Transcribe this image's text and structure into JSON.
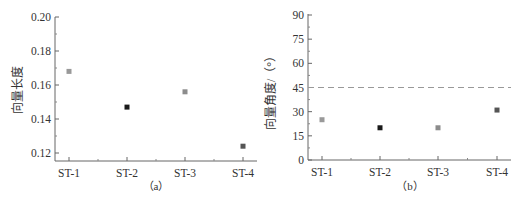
{
  "chart_data": [
    {
      "type": "scatter",
      "panel": "(a)",
      "caption": "（a）",
      "title": "",
      "xlabel": "",
      "ylabel": "向量长度",
      "categories": [
        "ST-1",
        "ST-2",
        "ST-3",
        "ST-4"
      ],
      "values": [
        0.168,
        0.147,
        0.156,
        0.124
      ],
      "marker_colors": [
        "#999999",
        "#1a1a1a",
        "#8c8c8c",
        "#555555"
      ],
      "ylim": [
        0.115,
        0.2
      ],
      "yticks": [
        0.12,
        0.14,
        0.16,
        0.18,
        0.2
      ],
      "ytick_labels": [
        "0.12",
        "0.14",
        "0.16",
        "0.18",
        "0.20"
      ],
      "grid": false
    },
    {
      "type": "scatter",
      "panel": "(b)",
      "caption": "（b）",
      "title": "",
      "xlabel": "",
      "ylabel": "向量角度/（°）",
      "categories": [
        "ST-1",
        "ST-2",
        "ST-3",
        "ST-4"
      ],
      "values": [
        25,
        20,
        20,
        31
      ],
      "marker_colors": [
        "#999999",
        "#1a1a1a",
        "#8c8c8c",
        "#555555"
      ],
      "ylim": [
        0,
        90
      ],
      "yticks": [
        0,
        15,
        30,
        45,
        60,
        75,
        90
      ],
      "ytick_labels": [
        "0",
        "15",
        "30",
        "45",
        "60",
        "75",
        "90"
      ],
      "reference_line": {
        "y": 45,
        "style": "dashed",
        "color": "#999999"
      },
      "grid": false
    }
  ]
}
